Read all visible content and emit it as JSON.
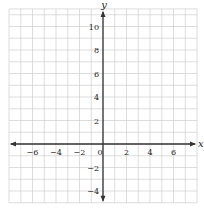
{
  "chart_data": {
    "type": "scatter",
    "title": "",
    "xlabel": "x",
    "ylabel": "y",
    "xlim": [
      -8,
      8
    ],
    "ylim": [
      -5,
      11.5
    ],
    "grid": true,
    "grid_step": 1,
    "x_ticks": [
      -6,
      -4,
      -2,
      0,
      2,
      4,
      6
    ],
    "y_ticks": [
      10,
      8,
      6,
      4,
      2,
      -2,
      -4
    ],
    "series": []
  },
  "layout": {
    "origin_px": [
      103,
      144
    ],
    "unit_px": 11.75,
    "grid_color": "#cfcfcf",
    "axis_color": "#333333"
  }
}
